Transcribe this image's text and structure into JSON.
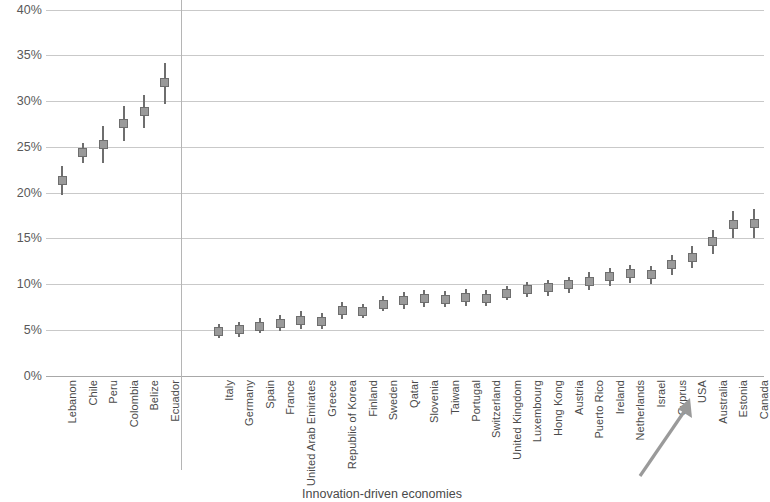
{
  "chart_data": {
    "type": "scatter",
    "title": "",
    "subtitle": "",
    "xlabel": "Innovation-driven economies",
    "ylabel": "",
    "ylim": [
      0,
      40
    ],
    "y_tick_labels": [
      "0%",
      "5%",
      "10%",
      "15%",
      "20%",
      "25%",
      "30%",
      "35%",
      "40%"
    ],
    "y_tick_values": [
      0,
      5,
      10,
      15,
      20,
      25,
      30,
      35,
      40
    ],
    "grid": true,
    "legend": "none",
    "marker_style": "point-with-error-bars",
    "group_divider_after_index": 5,
    "annotation": {
      "type": "arrow",
      "points_to": "USA",
      "label": ""
    },
    "categories": [
      "Lebanon",
      "Chile",
      "Peru",
      "Colombia",
      "Belize",
      "Ecuador",
      "Italy",
      "Germany",
      "Spain",
      "France",
      "United Arab Emirates",
      "Greece",
      "Republic of Korea",
      "Finland",
      "Sweden",
      "Qatar",
      "Slovenia",
      "Taiwan",
      "Portugal",
      "Switzerland",
      "United Kingdom",
      "Luxembourg",
      "Hong Kong",
      "Austria",
      "Puerto Rico",
      "Ireland",
      "Netherlands",
      "Israel",
      "Cyprus",
      "USA",
      "Australia",
      "Estonia",
      "Canada"
    ],
    "values": [
      21.3,
      24.4,
      25.2,
      27.5,
      28.9,
      32.0,
      4.8,
      5.0,
      5.4,
      5.7,
      6.0,
      5.9,
      7.1,
      7.0,
      7.8,
      8.2,
      8.4,
      8.3,
      8.5,
      8.4,
      9.0,
      9.4,
      9.6,
      9.9,
      10.3,
      10.8,
      11.1,
      11.0,
      12.1,
      12.9,
      14.6,
      16.5,
      16.6
    ],
    "ci_low": [
      19.7,
      23.2,
      23.2,
      25.6,
      27.0,
      29.7,
      4.1,
      4.2,
      4.6,
      4.9,
      5.1,
      5.1,
      6.2,
      6.3,
      7.0,
      7.3,
      7.5,
      7.5,
      7.6,
      7.6,
      8.3,
      8.6,
      8.7,
      9.0,
      9.3,
      9.8,
      10.1,
      10.0,
      11.0,
      11.8,
      13.3,
      15.0,
      15.0
    ],
    "ci_high": [
      22.9,
      25.4,
      27.3,
      29.4,
      30.7,
      34.2,
      5.6,
      5.9,
      6.3,
      6.6,
      7.0,
      6.8,
      8.0,
      7.8,
      8.7,
      9.1,
      9.3,
      9.2,
      9.4,
      9.3,
      9.8,
      10.2,
      10.4,
      10.8,
      11.3,
      11.8,
      12.1,
      12.0,
      13.2,
      14.1,
      15.9,
      18.0,
      18.2
    ]
  }
}
